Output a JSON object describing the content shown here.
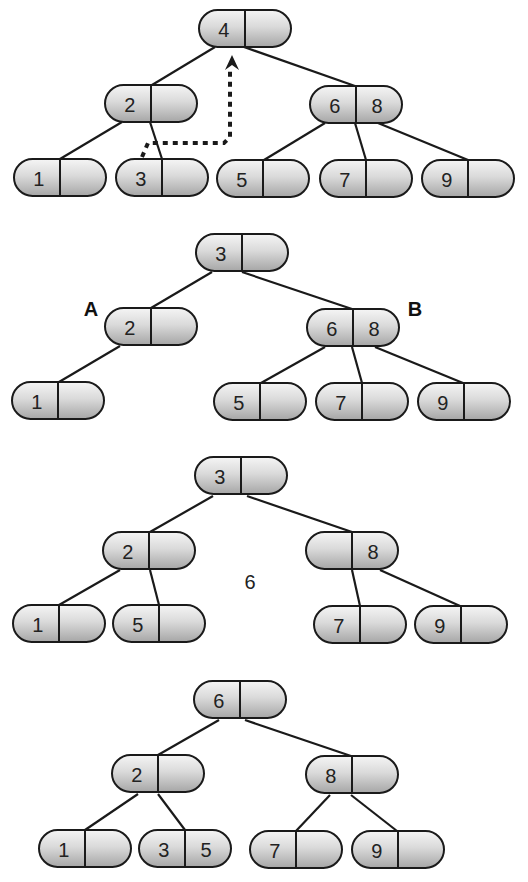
{
  "colors": {
    "stroke": "#1a1a1a",
    "node_fill_light": "#f5f5f5",
    "node_fill_dark": "#a6a6a6",
    "text": "#222222",
    "background": "#ffffff"
  },
  "node_size": {
    "w": 92,
    "h": 37
  },
  "diagrams": [
    {
      "id": "step-1",
      "nodes": [
        {
          "id": "n4",
          "x": 199,
          "y": 10,
          "keys": [
            "4",
            ""
          ]
        },
        {
          "id": "n2",
          "x": 105,
          "y": 85,
          "keys": [
            "2",
            ""
          ]
        },
        {
          "id": "n68",
          "x": 310,
          "y": 86,
          "keys": [
            "6",
            "8"
          ]
        },
        {
          "id": "n1",
          "x": 14,
          "y": 159,
          "keys": [
            "1",
            ""
          ]
        },
        {
          "id": "n3",
          "x": 116,
          "y": 159,
          "keys": [
            "3",
            ""
          ]
        },
        {
          "id": "n5",
          "x": 217,
          "y": 160,
          "keys": [
            "5",
            ""
          ]
        },
        {
          "id": "n7",
          "x": 320,
          "y": 160,
          "keys": [
            "7",
            ""
          ]
        },
        {
          "id": "n9",
          "x": 422,
          "y": 160,
          "keys": [
            "9",
            ""
          ]
        }
      ],
      "edges": [
        [
          215,
          47,
          152,
          85
        ],
        [
          244,
          47,
          355,
          86
        ],
        [
          122,
          122,
          60,
          159
        ],
        [
          150,
          122,
          162,
          159
        ],
        [
          325,
          123,
          264,
          160
        ],
        [
          355,
          123,
          366,
          160
        ],
        [
          378,
          123,
          468,
          160
        ]
      ],
      "dashed_arrow": {
        "points": [
          [
            142,
            157
          ],
          [
            148,
            143
          ],
          [
            224,
            143
          ],
          [
            230,
            137
          ],
          [
            230,
            68
          ]
        ],
        "arrow_tip": [
          232,
          55
        ],
        "meaning": "move successor 3 up to replace 4"
      },
      "labels": [],
      "floating_keys": []
    },
    {
      "id": "step-2",
      "nodes": [
        {
          "id": "n3",
          "x": 196,
          "y": 234,
          "keys": [
            "3",
            ""
          ]
        },
        {
          "id": "n2",
          "x": 105,
          "y": 308,
          "keys": [
            "2",
            ""
          ]
        },
        {
          "id": "n68",
          "x": 307,
          "y": 309,
          "keys": [
            "6",
            "8"
          ]
        },
        {
          "id": "n1",
          "x": 12,
          "y": 382,
          "keys": [
            "1",
            ""
          ]
        },
        {
          "id": "n5",
          "x": 214,
          "y": 383,
          "keys": [
            "5",
            ""
          ]
        },
        {
          "id": "n7",
          "x": 316,
          "y": 383,
          "keys": [
            "7",
            ""
          ]
        },
        {
          "id": "n9",
          "x": 418,
          "y": 383,
          "keys": [
            "9",
            ""
          ]
        }
      ],
      "edges": [
        [
          212,
          272,
          151,
          308
        ],
        [
          242,
          272,
          352,
          309
        ],
        [
          120,
          346,
          59,
          382
        ],
        [
          325,
          347,
          261,
          383
        ],
        [
          352,
          347,
          362,
          383
        ],
        [
          375,
          347,
          463,
          383
        ]
      ],
      "labels": [
        {
          "text": "A",
          "x": 91,
          "y": 309
        },
        {
          "text": "B",
          "x": 415,
          "y": 309
        }
      ],
      "floating_keys": []
    },
    {
      "id": "step-3",
      "nodes": [
        {
          "id": "n3",
          "x": 195,
          "y": 457,
          "keys": [
            "3",
            ""
          ]
        },
        {
          "id": "n2",
          "x": 103,
          "y": 532,
          "keys": [
            "2",
            ""
          ]
        },
        {
          "id": "n8",
          "x": 306,
          "y": 532,
          "keys": [
            "",
            "8"
          ]
        },
        {
          "id": "n1",
          "x": 13,
          "y": 605,
          "keys": [
            "1",
            ""
          ]
        },
        {
          "id": "n5",
          "x": 113,
          "y": 605,
          "keys": [
            "5",
            ""
          ]
        },
        {
          "id": "n7",
          "x": 314,
          "y": 606,
          "keys": [
            "7",
            ""
          ]
        },
        {
          "id": "n9",
          "x": 415,
          "y": 606,
          "keys": [
            "9",
            ""
          ]
        }
      ],
      "edges": [
        [
          213,
          496,
          150,
          532
        ],
        [
          247,
          496,
          352,
          532
        ],
        [
          120,
          570,
          59,
          605
        ],
        [
          150,
          570,
          159,
          605
        ],
        [
          352,
          570,
          360,
          606
        ],
        [
          380,
          570,
          460,
          606
        ]
      ],
      "labels": [],
      "floating_keys": [
        {
          "text": "6",
          "x": 250,
          "y": 582
        }
      ]
    },
    {
      "id": "step-4",
      "nodes": [
        {
          "id": "n6",
          "x": 194,
          "y": 681,
          "keys": [
            "6",
            ""
          ]
        },
        {
          "id": "n2",
          "x": 112,
          "y": 755,
          "keys": [
            "2",
            ""
          ]
        },
        {
          "id": "n8",
          "x": 306,
          "y": 756,
          "keys": [
            "8",
            ""
          ]
        },
        {
          "id": "n1",
          "x": 39,
          "y": 830,
          "keys": [
            "1",
            ""
          ]
        },
        {
          "id": "n35",
          "x": 139,
          "y": 830,
          "keys": [
            "3",
            "5"
          ]
        },
        {
          "id": "n7",
          "x": 250,
          "y": 831,
          "keys": [
            "7",
            ""
          ]
        },
        {
          "id": "n9",
          "x": 352,
          "y": 831,
          "keys": [
            "9",
            ""
          ]
        }
      ],
      "edges": [
        [
          219,
          720,
          158,
          755
        ],
        [
          245,
          720,
          351,
          756
        ],
        [
          138,
          794,
          85,
          830
        ],
        [
          158,
          794,
          185,
          830
        ],
        [
          330,
          795,
          296,
          831
        ],
        [
          351,
          795,
          397,
          831
        ]
      ],
      "labels": [],
      "floating_keys": []
    }
  ]
}
